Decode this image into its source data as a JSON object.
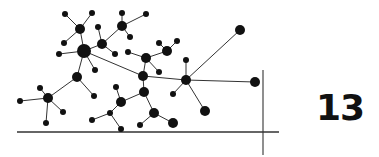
{
  "page_number": "13",
  "colors": {
    "ink": "#111111",
    "edge": "#333333",
    "background": "#ffffff"
  },
  "diagram": {
    "type": "network-graph",
    "nodes": [
      {
        "id": "n1",
        "x": 65,
        "y": 14,
        "r": 3
      },
      {
        "id": "n2",
        "x": 92,
        "y": 13,
        "r": 3
      },
      {
        "id": "n3",
        "x": 80,
        "y": 29,
        "r": 5
      },
      {
        "id": "n4",
        "x": 64,
        "y": 43,
        "r": 3
      },
      {
        "id": "n5",
        "x": 84,
        "y": 51,
        "r": 7
      },
      {
        "id": "n6",
        "x": 59,
        "y": 54,
        "r": 3
      },
      {
        "id": "n7",
        "x": 102,
        "y": 44,
        "r": 5
      },
      {
        "id": "n8",
        "x": 98,
        "y": 27,
        "r": 3
      },
      {
        "id": "n9",
        "x": 115,
        "y": 54,
        "r": 3
      },
      {
        "id": "n10",
        "x": 122,
        "y": 26,
        "r": 5
      },
      {
        "id": "n11",
        "x": 122,
        "y": 13,
        "r": 3
      },
      {
        "id": "n12",
        "x": 146,
        "y": 14,
        "r": 3
      },
      {
        "id": "n13",
        "x": 130,
        "y": 37,
        "r": 3
      },
      {
        "id": "n14",
        "x": 95,
        "y": 70,
        "r": 3
      },
      {
        "id": "n15",
        "x": 77,
        "y": 77,
        "r": 5
      },
      {
        "id": "n16",
        "x": 94,
        "y": 96,
        "r": 3
      },
      {
        "id": "n17",
        "x": 48,
        "y": 98,
        "r": 5
      },
      {
        "id": "n18",
        "x": 40,
        "y": 88,
        "r": 3
      },
      {
        "id": "n19",
        "x": 20,
        "y": 101,
        "r": 3
      },
      {
        "id": "n20",
        "x": 63,
        "y": 112,
        "r": 3
      },
      {
        "id": "n21",
        "x": 46,
        "y": 123,
        "r": 3
      },
      {
        "id": "n22",
        "x": 128,
        "y": 52,
        "r": 3
      },
      {
        "id": "n23",
        "x": 146,
        "y": 58,
        "r": 5
      },
      {
        "id": "n24",
        "x": 167,
        "y": 51,
        "r": 5
      },
      {
        "id": "n25",
        "x": 159,
        "y": 43,
        "r": 3
      },
      {
        "id": "n26",
        "x": 177,
        "y": 41,
        "r": 3
      },
      {
        "id": "n27",
        "x": 159,
        "y": 72,
        "r": 3
      },
      {
        "id": "n28",
        "x": 143,
        "y": 76,
        "r": 5
      },
      {
        "id": "n29",
        "x": 144,
        "y": 92,
        "r": 5
      },
      {
        "id": "n30",
        "x": 116,
        "y": 87,
        "r": 3
      },
      {
        "id": "n31",
        "x": 121,
        "y": 102,
        "r": 5
      },
      {
        "id": "n32",
        "x": 110,
        "y": 113,
        "r": 3
      },
      {
        "id": "n33",
        "x": 92,
        "y": 120,
        "r": 3
      },
      {
        "id": "n34",
        "x": 121,
        "y": 129,
        "r": 3
      },
      {
        "id": "n35",
        "x": 154,
        "y": 113,
        "r": 5
      },
      {
        "id": "n36",
        "x": 140,
        "y": 125,
        "r": 3
      },
      {
        "id": "n37",
        "x": 173,
        "y": 123,
        "r": 5
      },
      {
        "id": "n38",
        "x": 186,
        "y": 80,
        "r": 5
      },
      {
        "id": "n39",
        "x": 186,
        "y": 60,
        "r": 3
      },
      {
        "id": "n40",
        "x": 173,
        "y": 94,
        "r": 3
      },
      {
        "id": "n41",
        "x": 240,
        "y": 30,
        "r": 5
      },
      {
        "id": "n42",
        "x": 255,
        "y": 82,
        "r": 5
      },
      {
        "id": "n43",
        "x": 205,
        "y": 111,
        "r": 5
      }
    ],
    "edges": [
      [
        "n1",
        "n3"
      ],
      [
        "n2",
        "n3"
      ],
      [
        "n3",
        "n5"
      ],
      [
        "n4",
        "n3"
      ],
      [
        "n6",
        "n5"
      ],
      [
        "n5",
        "n7"
      ],
      [
        "n7",
        "n8"
      ],
      [
        "n7",
        "n9"
      ],
      [
        "n7",
        "n10"
      ],
      [
        "n10",
        "n11"
      ],
      [
        "n10",
        "n12"
      ],
      [
        "n10",
        "n13"
      ],
      [
        "n5",
        "n14"
      ],
      [
        "n5",
        "n15"
      ],
      [
        "n15",
        "n16"
      ],
      [
        "n15",
        "n17"
      ],
      [
        "n17",
        "n18"
      ],
      [
        "n17",
        "n19"
      ],
      [
        "n17",
        "n20"
      ],
      [
        "n17",
        "n21"
      ],
      [
        "n5",
        "n28"
      ],
      [
        "n22",
        "n23"
      ],
      [
        "n23",
        "n24"
      ],
      [
        "n24",
        "n25"
      ],
      [
        "n24",
        "n26"
      ],
      [
        "n23",
        "n27"
      ],
      [
        "n23",
        "n28"
      ],
      [
        "n28",
        "n29"
      ],
      [
        "n28",
        "n38"
      ],
      [
        "n29",
        "n31"
      ],
      [
        "n31",
        "n30"
      ],
      [
        "n31",
        "n32"
      ],
      [
        "n32",
        "n33"
      ],
      [
        "n32",
        "n34"
      ],
      [
        "n29",
        "n35"
      ],
      [
        "n35",
        "n36"
      ],
      [
        "n35",
        "n37"
      ],
      [
        "n38",
        "n39"
      ],
      [
        "n38",
        "n40"
      ],
      [
        "n38",
        "n41"
      ],
      [
        "n38",
        "n42"
      ],
      [
        "n38",
        "n43"
      ]
    ],
    "axis_lines": [
      {
        "x1": 17,
        "y1": 132,
        "x2": 279,
        "y2": 132
      },
      {
        "x1": 263,
        "y1": 70,
        "x2": 263,
        "y2": 155
      }
    ]
  }
}
